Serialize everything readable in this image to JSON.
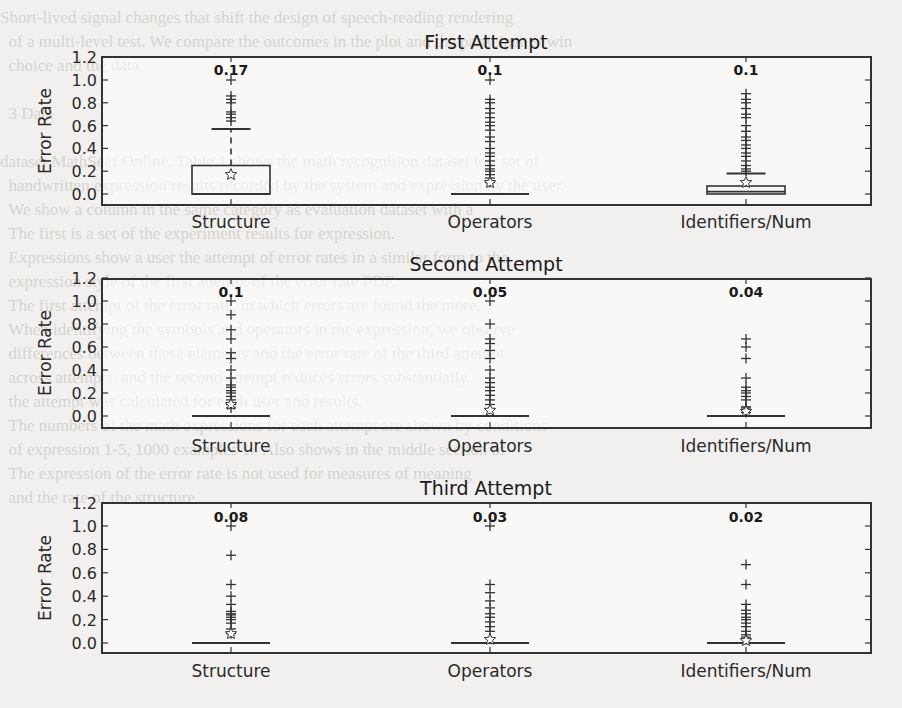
{
  "background": {
    "lines": [
      "Short-lived signal changes that shift the design of speech-reading rendering",
      "  of a multi-level test. We compare the outcomes in the plot and the participants' win",
      "  choice and the data.",
      "",
      "  3 Data",
      "",
      "dataset MathSeer Online. Table 1 shows the math recognition dataset test set of",
      "  handwritten expression results recorded by the system and expression by the user.",
      "  We show a column in the same category as evaluation dataset with a",
      "  The first is a set of the experiment results for expression.",
      "  Expressions show a user the attempt of error rates in a similar form to the",
      "  expression style of the first attempt of the error rate PDF.",
      "  The first attempt of the error rate, in which errors are found the more.",
      "  When identifying the symbols and operators in the expression, we observe",
      "  differences between these elements and the error rate of the third attempt",
      "  across attempts, and the second attempt reduces errors substantially.",
      "  the attempt was calculated for each user and results.",
      "  The numbers of the math expressions for each attempt are shown by conditions",
      "  of expression 1-5, 1000 examples 1.  Also shows in the middle section of",
      "  The expression of the error rate is not used for measures of meaning",
      "  and the rate of the structure"
    ]
  },
  "colors": {
    "ink": "#333333",
    "paper": "#f1f0ee",
    "plot_bg": "#ffffff"
  },
  "chart_data": [
    {
      "type": "box",
      "title": "First Attempt",
      "xlabel": "",
      "ylabel": "Error Rate",
      "ylim": [
        -0.1,
        1.2
      ],
      "yticks": [
        "0.0",
        "0.2",
        "0.4",
        "0.6",
        "0.8",
        "1.0",
        "1.2"
      ],
      "grid": false,
      "categories": [
        "Structure",
        "Operators",
        "Identifiers/Num"
      ],
      "mean_labels": [
        "0.17",
        "0.1",
        "0.1"
      ],
      "series": [
        {
          "name": "Structure",
          "q1": 0.0,
          "median": 0.0,
          "q3": 0.25,
          "whisker_low": 0.0,
          "whisker_high": 0.57,
          "mean": 0.17,
          "fliers": [
            0.64,
            0.67,
            0.7,
            0.72,
            0.8,
            0.83,
            0.86,
            1.0
          ]
        },
        {
          "name": "Operators",
          "q1": 0.0,
          "median": 0.0,
          "q3": 0.0,
          "whisker_low": 0.0,
          "whisker_high": 0.0,
          "mean": 0.1,
          "fliers": [
            0.1,
            0.14,
            0.17,
            0.2,
            0.22,
            0.25,
            0.29,
            0.33,
            0.36,
            0.4,
            0.46,
            0.5,
            0.56,
            0.6,
            0.63,
            0.67,
            0.71,
            0.75,
            0.8,
            0.83,
            1.0
          ]
        },
        {
          "name": "Identifiers/Num",
          "q1": 0.0,
          "median": 0.02,
          "q3": 0.07,
          "whisker_low": 0.0,
          "whisker_high": 0.18,
          "mean": 0.1,
          "fliers": [
            0.2,
            0.22,
            0.25,
            0.29,
            0.33,
            0.36,
            0.4,
            0.43,
            0.47,
            0.5,
            0.55,
            0.6,
            0.67,
            0.7,
            0.75,
            0.8,
            0.83,
            0.88
          ]
        }
      ]
    },
    {
      "type": "box",
      "title": "Second Attempt",
      "xlabel": "",
      "ylabel": "Error Rate",
      "ylim": [
        -0.1,
        1.2
      ],
      "yticks": [
        "0.0",
        "0.2",
        "0.4",
        "0.6",
        "0.8",
        "1.0",
        "1.2"
      ],
      "grid": false,
      "categories": [
        "Structure",
        "Operators",
        "Identifiers/Num"
      ],
      "mean_labels": [
        "0.1",
        "0.05",
        "0.04"
      ],
      "series": [
        {
          "name": "Structure",
          "q1": 0.0,
          "median": 0.0,
          "q3": 0.0,
          "whisker_low": 0.0,
          "whisker_high": 0.0,
          "mean": 0.1,
          "fliers": [
            0.07,
            0.1,
            0.14,
            0.17,
            0.2,
            0.22,
            0.25,
            0.27,
            0.33,
            0.4,
            0.5,
            0.55,
            0.67,
            0.75,
            0.88,
            1.0
          ]
        },
        {
          "name": "Operators",
          "q1": 0.0,
          "median": 0.0,
          "q3": 0.0,
          "whisker_low": 0.0,
          "whisker_high": 0.0,
          "mean": 0.05,
          "fliers": [
            0.06,
            0.1,
            0.14,
            0.18,
            0.22,
            0.25,
            0.29,
            0.33,
            0.4,
            0.5,
            0.57,
            0.63,
            0.67,
            0.8,
            1.0
          ]
        },
        {
          "name": "Identifiers/Num",
          "q1": 0.0,
          "median": 0.0,
          "q3": 0.0,
          "whisker_low": 0.0,
          "whisker_high": 0.0,
          "mean": 0.04,
          "fliers": [
            0.03,
            0.05,
            0.07,
            0.08,
            0.14,
            0.17,
            0.2,
            0.22,
            0.25,
            0.33,
            0.5,
            0.6,
            0.67
          ]
        }
      ]
    },
    {
      "type": "box",
      "title": "Third Attempt",
      "xlabel": "",
      "ylabel": "Error Rate",
      "ylim": [
        -0.1,
        1.2
      ],
      "yticks": [
        "0.0",
        "0.2",
        "0.4",
        "0.6",
        "0.8",
        "1.0",
        "1.2"
      ],
      "grid": false,
      "categories": [
        "Structure",
        "Operators",
        "Identifiers/Num"
      ],
      "mean_labels": [
        "0.08",
        "0.03",
        "0.02"
      ],
      "series": [
        {
          "name": "Structure",
          "q1": 0.0,
          "median": 0.0,
          "q3": 0.0,
          "whisker_low": 0.0,
          "whisker_high": 0.0,
          "mean": 0.08,
          "fliers": [
            0.08,
            0.12,
            0.17,
            0.2,
            0.22,
            0.24,
            0.25,
            0.27,
            0.33,
            0.4,
            0.5,
            0.75,
            1.0
          ]
        },
        {
          "name": "Operators",
          "q1": 0.0,
          "median": 0.0,
          "q3": 0.0,
          "whisker_low": 0.0,
          "whisker_high": 0.0,
          "mean": 0.03,
          "fliers": [
            0.04,
            0.1,
            0.14,
            0.18,
            0.22,
            0.25,
            0.3,
            0.36,
            0.43,
            0.5,
            1.0
          ]
        },
        {
          "name": "Identifiers/Num",
          "q1": 0.0,
          "median": 0.0,
          "q3": 0.0,
          "whisker_low": 0.0,
          "whisker_high": 0.0,
          "mean": 0.02,
          "fliers": [
            0.03,
            0.05,
            0.07,
            0.1,
            0.14,
            0.17,
            0.2,
            0.22,
            0.25,
            0.28,
            0.33,
            0.5,
            0.67
          ]
        }
      ]
    }
  ]
}
